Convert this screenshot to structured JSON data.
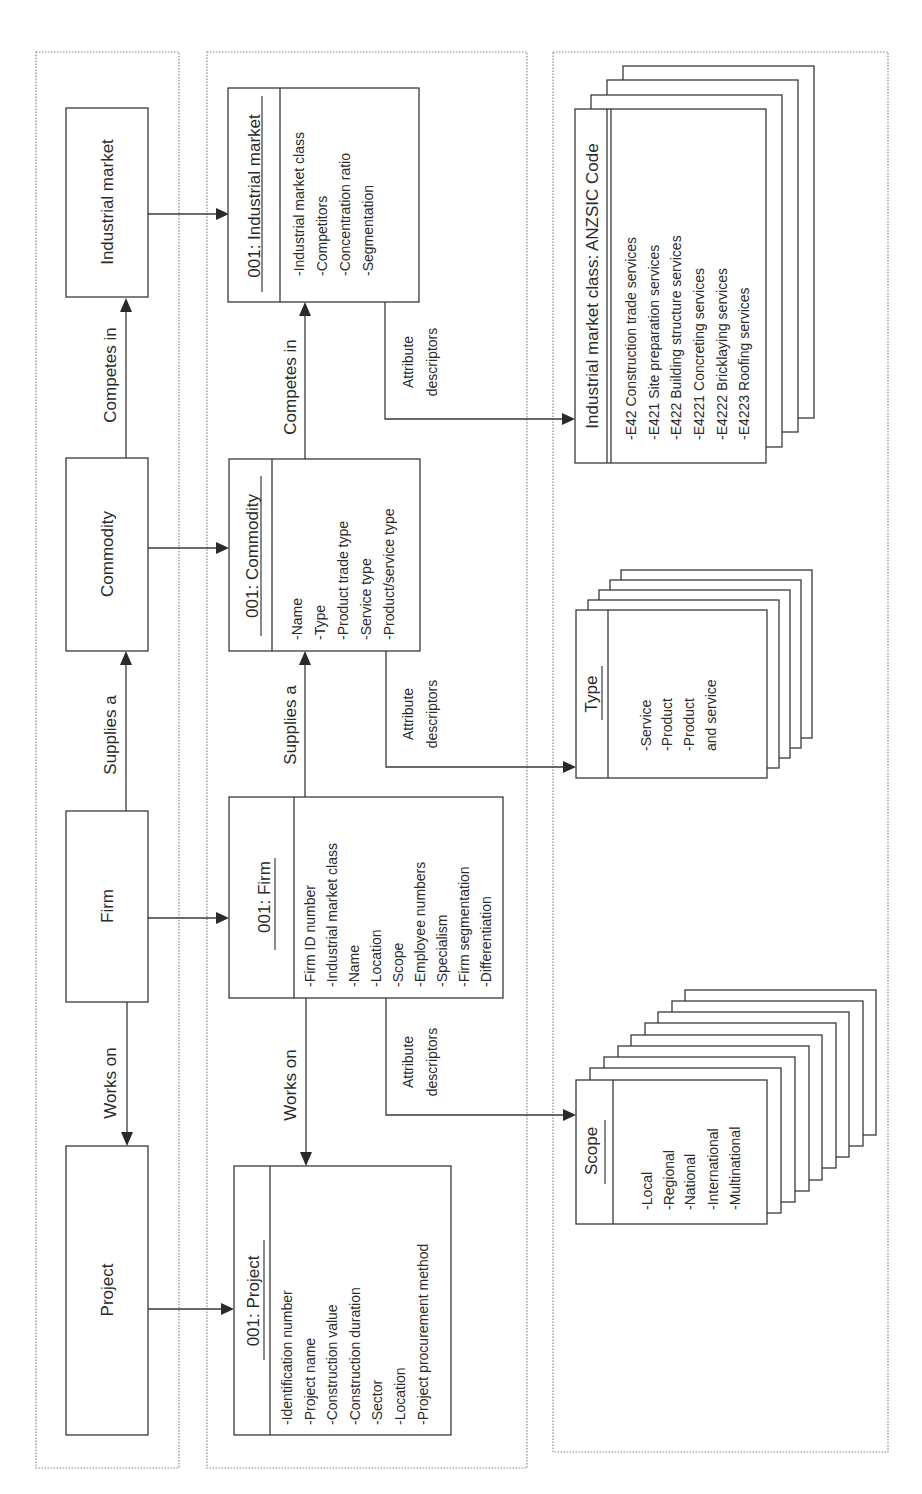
{
  "entities": {
    "industrial_market": "Industrial market",
    "commodity": "Commodity",
    "firm": "Firm",
    "project": "Project"
  },
  "relations": {
    "competes_in": "Competes in",
    "supplies_a": "Supplies a",
    "works_on": "Works on",
    "attr_line1": "Attribute",
    "attr_line2": "descriptors"
  },
  "instances": {
    "industrial_market": {
      "title": "001: Industrial market",
      "attributes": [
        "-Industrial market class",
        "-Competitors",
        "-Concentration ratio",
        "-Segmentation"
      ]
    },
    "commodity": {
      "title": "001: Commodity",
      "attributes": [
        "-Name",
        "-Type",
        "-Product trade type",
        "-Service type",
        "-Product/service type"
      ]
    },
    "firm": {
      "title": "001: Firm",
      "attributes": [
        "-Firm ID number",
        "-Industrial market class",
        "-Name",
        "-Location",
        "-Scope",
        "-Employee numbers",
        "-Specialism",
        "-Firm segmentation",
        "-Differentiation"
      ]
    },
    "project": {
      "title": "001: Project",
      "attributes": [
        "-Identification number",
        "-Project name",
        "-Construction value",
        "-Construction duration",
        "-Sector",
        "-Location",
        "-Project procurement method"
      ]
    }
  },
  "descriptors": {
    "anzsic": {
      "title": "Industrial market class: ANZSIC Code",
      "items": [
        "-E42 Construction trade services",
        "-E421 Site preparation services",
        "-E422 Building structure services",
        "-E4221 Concreting services",
        "-E4222 Bricklaying services",
        "-E4223 Roofing services"
      ]
    },
    "type": {
      "title": "Type",
      "items": [
        "-Service",
        "-Product",
        "-Product",
        " and service"
      ]
    },
    "scope": {
      "title": "Scope",
      "items": [
        "-Local",
        "-Regional",
        "-National",
        "-International",
        "-Multinational"
      ]
    }
  }
}
